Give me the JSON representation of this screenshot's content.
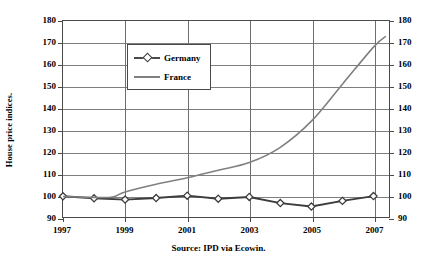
{
  "chart_data": {
    "type": "line",
    "title": "",
    "xlabel": "",
    "ylabel": "House price indices.",
    "source_note": "Source: IPD via Ecowin.",
    "xlim": [
      1997,
      2007.5
    ],
    "ylim": [
      90,
      180
    ],
    "y_ticks": [
      180,
      170,
      160,
      150,
      140,
      130,
      120,
      110,
      100,
      90
    ],
    "y_ticks_right": [
      180,
      170,
      160,
      150,
      140,
      130,
      120,
      110,
      100,
      90
    ],
    "x_ticks": [
      1997,
      1999,
      2001,
      2003,
      2005,
      2007
    ],
    "grid": "horizontal-and-vertical",
    "legend_position": "top-left",
    "legend": [
      "Germany",
      "France"
    ],
    "series": [
      {
        "name": "Germany",
        "color": "#3c3c3c",
        "marker": "diamond",
        "x": [
          1997.0,
          1998.0,
          1999.0,
          2000.0,
          2001.0,
          2002.0,
          2003.0,
          2004.0,
          2005.0,
          2006.0,
          2007.0
        ],
        "values": [
          99.5,
          98.6,
          98.0,
          98.7,
          99.8,
          98.4,
          99.2,
          96.4,
          94.8,
          97.4,
          99.6
        ]
      },
      {
        "name": "France",
        "color": "#808080",
        "marker": "none",
        "x": [
          1997.0,
          1998.0,
          1998.6,
          1999.0,
          2000.0,
          2001.0,
          2002.0,
          2003.0,
          2004.0,
          2005.0,
          2006.0,
          2007.0,
          2007.4
        ],
        "values": [
          99.4,
          99.0,
          99.2,
          101.5,
          105.0,
          108.0,
          111.5,
          115.0,
          122.0,
          134.0,
          151.0,
          168.0,
          173.0
        ]
      }
    ]
  },
  "axis": {
    "y_title": "House price indices."
  },
  "footer": {
    "source": "Source: IPD via Ecowin."
  },
  "legend": {
    "items": [
      {
        "label": "Germany"
      },
      {
        "label": "France"
      }
    ]
  }
}
